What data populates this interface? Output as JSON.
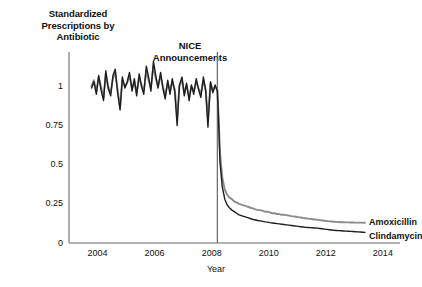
{
  "chart_data": {
    "type": "line",
    "title": "Standardized Prescriptions by Antibiotic",
    "title_lines": [
      "Standardized",
      "Prescriptions by",
      "Antibiotic"
    ],
    "xlabel": "Year",
    "ylabel": "",
    "xlim": [
      2003.0,
      2014.6
    ],
    "ylim": [
      0,
      1.22
    ],
    "xticks": [
      2004,
      2006,
      2008,
      2010,
      2012,
      2014
    ],
    "xticklabels": [
      "2004",
      "2006",
      "2008",
      "2010",
      "2012",
      "2014"
    ],
    "yticks": [
      0,
      0.25,
      0.5,
      0.75,
      1
    ],
    "yticklabels": [
      "0",
      "0.25",
      "0.5",
      "0.75",
      "1"
    ],
    "grid": false,
    "legend_position": "right-inline",
    "annotations": [
      {
        "name": "nice-announcements",
        "text": "NICE Announcements",
        "text_lines": [
          "NICE",
          "Announcements"
        ],
        "x": 2008.2,
        "type": "vline",
        "color": "#6f6f6f"
      }
    ],
    "series": [
      {
        "name": "Amoxicillin",
        "color": "#8c8c8c",
        "width": 1.9,
        "x": [
          2003.79,
          2003.87,
          2003.96,
          2004.04,
          2004.12,
          2004.21,
          2004.29,
          2004.37,
          2004.46,
          2004.54,
          2004.62,
          2004.71,
          2004.79,
          2004.87,
          2004.96,
          2005.04,
          2005.12,
          2005.21,
          2005.29,
          2005.37,
          2005.46,
          2005.54,
          2005.62,
          2005.71,
          2005.79,
          2005.87,
          2005.96,
          2006.04,
          2006.12,
          2006.21,
          2006.29,
          2006.37,
          2006.46,
          2006.54,
          2006.62,
          2006.71,
          2006.79,
          2006.87,
          2006.96,
          2007.04,
          2007.12,
          2007.21,
          2007.29,
          2007.37,
          2007.46,
          2007.54,
          2007.62,
          2007.71,
          2007.79,
          2007.87,
          2007.96,
          2008.04,
          2008.12,
          2008.2,
          2008.25,
          2008.29,
          2008.37,
          2008.46,
          2008.54,
          2008.62,
          2008.71,
          2008.79,
          2008.87,
          2008.96,
          2009.04,
          2009.12,
          2009.21,
          2009.29,
          2009.37,
          2009.46,
          2009.54,
          2009.62,
          2009.71,
          2009.79,
          2009.87,
          2009.96,
          2010.04,
          2010.12,
          2010.21,
          2010.29,
          2010.37,
          2010.46,
          2010.54,
          2010.62,
          2010.71,
          2010.79,
          2010.87,
          2010.96,
          2011.04,
          2011.12,
          2011.21,
          2011.29,
          2011.37,
          2011.46,
          2011.54,
          2011.62,
          2011.71,
          2011.79,
          2011.87,
          2011.96,
          2012.04,
          2012.12,
          2012.21,
          2012.29,
          2012.37,
          2012.46,
          2012.54,
          2012.62,
          2012.71,
          2012.79,
          2012.87,
          2012.96,
          2013.04,
          2013.12,
          2013.21,
          2013.29,
          2013.37
        ],
        "values": [
          1.0,
          1.04,
          0.97,
          1.06,
          1.0,
          0.93,
          1.08,
          1.0,
          0.96,
          1.05,
          1.09,
          0.97,
          0.87,
          1.04,
          1.0,
          1.02,
          1.07,
          0.99,
          1.03,
          0.96,
          1.06,
          1.01,
          0.97,
          1.1,
          1.04,
          0.99,
          1.13,
          1.05,
          1.0,
          1.07,
          1.0,
          0.94,
          1.02,
          0.97,
          1.03,
          0.98,
          0.8,
          1.0,
          1.04,
          0.96,
          1.01,
          0.93,
          1.0,
          0.97,
          1.03,
          0.99,
          0.95,
          1.04,
          0.98,
          0.8,
          1.02,
          0.97,
          1.0,
          0.98,
          0.78,
          0.58,
          0.42,
          0.34,
          0.31,
          0.29,
          0.28,
          0.265,
          0.26,
          0.25,
          0.245,
          0.24,
          0.235,
          0.23,
          0.225,
          0.22,
          0.215,
          0.21,
          0.21,
          0.205,
          0.2,
          0.2,
          0.195,
          0.19,
          0.19,
          0.185,
          0.185,
          0.18,
          0.18,
          0.178,
          0.175,
          0.172,
          0.17,
          0.168,
          0.165,
          0.163,
          0.16,
          0.158,
          0.156,
          0.154,
          0.152,
          0.15,
          0.148,
          0.146,
          0.144,
          0.142,
          0.14,
          0.138,
          0.137,
          0.136,
          0.135,
          0.134,
          0.133,
          0.133,
          0.132,
          0.132,
          0.131,
          0.131,
          0.13,
          0.13,
          0.13,
          0.129,
          0.129
        ]
      },
      {
        "name": "Clindamycin",
        "color": "#1e1e1e",
        "width": 1.4,
        "x": [
          2003.79,
          2003.87,
          2003.96,
          2004.04,
          2004.12,
          2004.21,
          2004.29,
          2004.37,
          2004.46,
          2004.54,
          2004.62,
          2004.71,
          2004.79,
          2004.87,
          2004.96,
          2005.04,
          2005.12,
          2005.21,
          2005.29,
          2005.37,
          2005.46,
          2005.54,
          2005.62,
          2005.71,
          2005.79,
          2005.87,
          2005.96,
          2006.04,
          2006.12,
          2006.21,
          2006.29,
          2006.37,
          2006.46,
          2006.54,
          2006.62,
          2006.71,
          2006.79,
          2006.87,
          2006.96,
          2007.04,
          2007.12,
          2007.21,
          2007.29,
          2007.37,
          2007.46,
          2007.54,
          2007.62,
          2007.71,
          2007.79,
          2007.87,
          2007.96,
          2008.04,
          2008.12,
          2008.2,
          2008.25,
          2008.29,
          2008.37,
          2008.46,
          2008.54,
          2008.62,
          2008.71,
          2008.79,
          2008.87,
          2008.96,
          2009.04,
          2009.12,
          2009.21,
          2009.29,
          2009.37,
          2009.46,
          2009.54,
          2009.62,
          2009.71,
          2009.79,
          2009.87,
          2009.96,
          2010.04,
          2010.12,
          2010.21,
          2010.29,
          2010.37,
          2010.46,
          2010.54,
          2010.62,
          2010.71,
          2010.79,
          2010.87,
          2010.96,
          2011.04,
          2011.12,
          2011.21,
          2011.29,
          2011.37,
          2011.46,
          2011.54,
          2011.62,
          2011.71,
          2011.79,
          2011.87,
          2011.96,
          2012.04,
          2012.12,
          2012.21,
          2012.29,
          2012.37,
          2012.46,
          2012.54,
          2012.62,
          2012.71,
          2012.79,
          2012.87,
          2012.96,
          2013.04,
          2013.12,
          2013.21,
          2013.29,
          2013.37
        ],
        "values": [
          0.99,
          1.03,
          0.95,
          1.07,
          0.98,
          0.91,
          1.1,
          0.99,
          0.94,
          1.07,
          1.11,
          0.95,
          0.85,
          1.06,
          0.99,
          1.03,
          1.09,
          0.97,
          1.05,
          0.94,
          1.08,
          1.0,
          0.95,
          1.13,
          1.06,
          0.97,
          1.16,
          1.07,
          0.99,
          1.09,
          0.99,
          0.92,
          1.04,
          0.95,
          1.05,
          0.96,
          0.75,
          1.01,
          1.06,
          0.94,
          1.02,
          0.91,
          1.01,
          0.95,
          1.05,
          0.98,
          0.93,
          1.06,
          0.97,
          0.74,
          1.03,
          0.96,
          1.01,
          0.97,
          0.74,
          0.52,
          0.36,
          0.28,
          0.245,
          0.225,
          0.21,
          0.2,
          0.19,
          0.18,
          0.175,
          0.17,
          0.165,
          0.16,
          0.155,
          0.15,
          0.147,
          0.144,
          0.141,
          0.138,
          0.135,
          0.133,
          0.13,
          0.128,
          0.126,
          0.124,
          0.122,
          0.12,
          0.118,
          0.116,
          0.114,
          0.112,
          0.11,
          0.108,
          0.106,
          0.104,
          0.102,
          0.1,
          0.099,
          0.098,
          0.097,
          0.096,
          0.095,
          0.093,
          0.091,
          0.089,
          0.087,
          0.085,
          0.083,
          0.081,
          0.08,
          0.079,
          0.078,
          0.077,
          0.076,
          0.075,
          0.074,
          0.073,
          0.072,
          0.071,
          0.07,
          0.069,
          0.068
        ]
      }
    ]
  }
}
